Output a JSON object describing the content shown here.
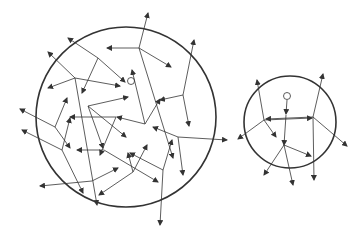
{
  "diagram": {
    "large_circle": {
      "cx": 126,
      "cy": 117,
      "r": 90
    },
    "small_circle": {
      "cx": 290,
      "cy": 122,
      "r": 46
    },
    "large_origin": {
      "cx": 131,
      "cy": 81
    },
    "small_origin": {
      "cx": 287,
      "cy": 96
    },
    "colors": {
      "stroke": "#333333",
      "background": "#ffffff"
    }
  }
}
